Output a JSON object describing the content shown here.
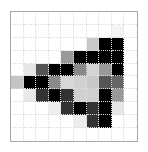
{
  "grid": {
    "rows": 10,
    "cols": 10,
    "frame_color": "#a8a8a8",
    "gridline_color": "#dcdcdc",
    "cells": [
      [
        "#ffffff",
        "#ffffff",
        "#ffffff",
        "#ffffff",
        "#ffffff",
        "#ffffff",
        "#ffffff",
        "#ffffff",
        "#ffffff",
        "#ffffff"
      ],
      [
        "#ffffff",
        "#ffffff",
        "#ffffff",
        "#ffffff",
        "#ffffff",
        "#ffffff",
        "#ffffff",
        "#ffffff",
        "#f4f4f4",
        "#ffffff"
      ],
      [
        "#ffffff",
        "#ffffff",
        "#ffffff",
        "#ffffff",
        "#ffffff",
        "#ffffff",
        "#c8c8c8",
        "#000000",
        "#000000",
        "#ffffff"
      ],
      [
        "#ffffff",
        "#ffffff",
        "#ffffff",
        "#ffffff",
        "#999999",
        "#000000",
        "#000000",
        "#000000",
        "#000000",
        "#ffffff"
      ],
      [
        "#ffffff",
        "#e6e6e6",
        "#555555",
        "#000000",
        "#000000",
        "#888888",
        "#d4d4d4",
        "#999999",
        "#000000",
        "#ffffff"
      ],
      [
        "#c4c4c4",
        "#000000",
        "#000000",
        "#8a8a8a",
        "#d8d8d8",
        "#d0d0d0",
        "#c8c8c8",
        "#555555",
        "#666666",
        "#ffffff"
      ],
      [
        "#ffffff",
        "#e8e8e8",
        "#333333",
        "#000000",
        "#333333",
        "#d0d0d0",
        "#cfcfcf",
        "#000000",
        "#999999",
        "#ffffff"
      ],
      [
        "#ffffff",
        "#ffffff",
        "#ffffff",
        "#eeeeee",
        "#333333",
        "#000000",
        "#333333",
        "#000000",
        "#e6e6e6",
        "#ffffff"
      ],
      [
        "#ffffff",
        "#ffffff",
        "#ffffff",
        "#ffffff",
        "#ffffff",
        "#ededed",
        "#333333",
        "#000000",
        "#ffffff",
        "#ffffff"
      ],
      [
        "#ffffff",
        "#ffffff",
        "#ffffff",
        "#ffffff",
        "#ffffff",
        "#ffffff",
        "#ffffff",
        "#ffffff",
        "#ffffff",
        "#ffffff"
      ]
    ]
  }
}
